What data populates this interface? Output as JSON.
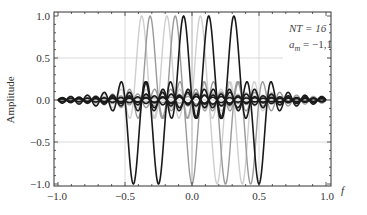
{
  "chart_data": {
    "type": "line",
    "title": "",
    "xlabel": "f",
    "ylabel": "Amplitude",
    "xlim": [
      -1.0,
      1.0
    ],
    "ylim": [
      -1.05,
      1.05
    ],
    "x_ticks": [
      "-1.0",
      "-0.5",
      "0.0",
      "0.5",
      "1.0"
    ],
    "y_ticks": [
      "-1.0",
      "-0.5",
      "0.0",
      "0.5",
      "1.0"
    ],
    "grid": true,
    "grid_lines": {
      "x": [
        -0.5,
        0.0,
        0.5
      ],
      "y": [
        -0.5,
        0.5
      ]
    },
    "annotations": [
      {
        "text": "NT = 16",
        "position": "top-right"
      },
      {
        "text": "a_m = -1,1",
        "position": "top-right"
      }
    ],
    "NT": 16,
    "series": [
      {
        "name": "pulse 1",
        "color": "#cfcfcf",
        "center": -0.375,
        "amplitude": 1
      },
      {
        "name": "pulse 2",
        "color": "#9a9a9a",
        "center": -0.3125,
        "amplitude": 1
      },
      {
        "name": "pulse 3",
        "color": "#cfcfcf",
        "center": -0.1875,
        "amplitude": 1
      },
      {
        "name": "pulse 4",
        "color": "#9a9a9a",
        "center": -0.125,
        "amplitude": 1
      },
      {
        "name": "pulse 5",
        "color": "#1a1a1a",
        "center": -0.0625,
        "amplitude": 1
      },
      {
        "name": "pulse 6",
        "color": "#cfcfcf",
        "center": 0.0625,
        "amplitude": 1
      },
      {
        "name": "pulse 7",
        "color": "#1a1a1a",
        "center": 0.125,
        "amplitude": 1
      },
      {
        "name": "pulse 8",
        "color": "#1a1a1a",
        "center": 0.3125,
        "amplitude": 1
      },
      {
        "name": "pulse 9",
        "color": "#1a1a1a",
        "center": -0.4375,
        "amplitude": -1
      },
      {
        "name": "pulse 10",
        "color": "#1a1a1a",
        "center": -0.25,
        "amplitude": -1
      },
      {
        "name": "pulse 11",
        "color": "#9a9a9a",
        "center": 0.0,
        "amplitude": -1
      },
      {
        "name": "pulse 12",
        "color": "#cfcfcf",
        "center": 0.1875,
        "amplitude": -1
      },
      {
        "name": "pulse 13",
        "color": "#9a9a9a",
        "center": 0.25,
        "amplitude": -1
      },
      {
        "name": "pulse 14",
        "color": "#cfcfcf",
        "center": 0.375,
        "amplitude": -1
      },
      {
        "name": "pulse 15",
        "color": "#9a9a9a",
        "center": 0.4375,
        "amplitude": -1
      },
      {
        "name": "pulse 16",
        "color": "#1a1a1a",
        "center": 0.5,
        "amplitude": -1
      }
    ]
  },
  "labels": {
    "xlabel": "f",
    "ylabel": "Amplitude",
    "annot_nt": "NT = 16",
    "annot_am_base": "a",
    "annot_am_sub": "m",
    "annot_am_val": " = −1,1",
    "x_ticks": [
      "−1.0",
      "−0.5",
      "0.0",
      "0.5",
      "1.0"
    ],
    "y_ticks": [
      "1.0",
      "0.5",
      "0.0",
      "−0.5",
      "−1.0"
    ]
  }
}
